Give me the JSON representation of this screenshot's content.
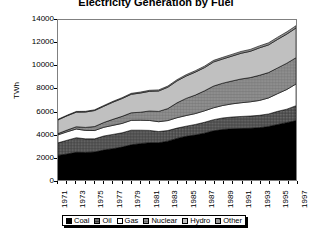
{
  "chart": {
    "title": "Electricity Generation by Fuel",
    "ylabel": "TWh"
  },
  "chart_data": {
    "type": "area",
    "title": "Electricity Generation by Fuel",
    "xlabel": "",
    "ylabel": "TWh",
    "ylim": [
      0,
      14000
    ],
    "ytick_labels": [
      "14000",
      "12000",
      "10000",
      "8000",
      "6000",
      "4000",
      "2000",
      "0"
    ],
    "ytick_values": [
      14000,
      12000,
      10000,
      8000,
      6000,
      4000,
      2000,
      0
    ],
    "grid": false,
    "stacked": true,
    "legend_position": "bottom",
    "x": [
      1971,
      1972,
      1973,
      1974,
      1975,
      1976,
      1977,
      1978,
      1979,
      1980,
      1981,
      1982,
      1983,
      1984,
      1985,
      1986,
      1987,
      1988,
      1989,
      1990,
      1991,
      1992,
      1993,
      1994,
      1995,
      1996,
      1997
    ],
    "xtick_labels": [
      "1971",
      "1973",
      "1975",
      "1977",
      "1979",
      "1981",
      "1983",
      "1985",
      "1987",
      "1989",
      "1991",
      "1993",
      "1995",
      "1997"
    ],
    "xtick_values": [
      1971,
      1973,
      1975,
      1977,
      1979,
      1981,
      1983,
      1985,
      1987,
      1989,
      1991,
      1993,
      1995,
      1997
    ],
    "series": [
      {
        "name": "Coal",
        "color": "#000000",
        "pattern": "solid",
        "values": [
          2150,
          2280,
          2420,
          2400,
          2450,
          2620,
          2740,
          2880,
          3080,
          3180,
          3260,
          3260,
          3400,
          3640,
          3830,
          3930,
          4100,
          4300,
          4420,
          4480,
          4500,
          4520,
          4580,
          4680,
          4860,
          5020,
          5200
        ]
      },
      {
        "name": "Oil",
        "color": "#666666",
        "pattern": "crosshatch",
        "values": [
          1100,
          1200,
          1280,
          1200,
          1150,
          1230,
          1250,
          1250,
          1280,
          1180,
          1080,
          980,
          930,
          900,
          880,
          930,
          950,
          980,
          1010,
          1030,
          1060,
          1080,
          1080,
          1100,
          1150,
          1180,
          1300
        ]
      },
      {
        "name": "Gas",
        "color": "#ffffff",
        "pattern": "solid",
        "values": [
          700,
          740,
          760,
          740,
          730,
          760,
          790,
          820,
          860,
          870,
          870,
          860,
          870,
          910,
          930,
          950,
          1000,
          1040,
          1090,
          1150,
          1200,
          1240,
          1300,
          1400,
          1550,
          1720,
          1900
        ]
      },
      {
        "name": "Nuclear",
        "color": "#808080",
        "pattern": "hatch",
        "values": [
          110,
          150,
          200,
          260,
          350,
          420,
          530,
          620,
          660,
          700,
          830,
          900,
          1050,
          1300,
          1500,
          1620,
          1750,
          1900,
          1950,
          2000,
          2080,
          2120,
          2200,
          2220,
          2250,
          2300,
          2300
        ]
      },
      {
        "name": "Hydro",
        "color": "#c0c0c0",
        "pattern": "solid",
        "values": [
          1200,
          1250,
          1280,
          1350,
          1400,
          1420,
          1500,
          1560,
          1620,
          1680,
          1720,
          1790,
          1870,
          1920,
          1960,
          2010,
          2030,
          2110,
          2120,
          2180,
          2250,
          2300,
          2400,
          2420,
          2500,
          2550,
          2600
        ]
      },
      {
        "name": "Other",
        "color": "#999999",
        "pattern": "dense",
        "values": [
          50,
          55,
          58,
          60,
          62,
          66,
          70,
          74,
          80,
          85,
          90,
          95,
          100,
          108,
          115,
          122,
          130,
          138,
          145,
          152,
          158,
          165,
          172,
          180,
          188,
          194,
          200
        ]
      }
    ],
    "totals": [
      5310,
      5675,
      5998,
      6010,
      6142,
      6518,
      6880,
      7204,
      7580,
      7693,
      7850,
      7885,
      8220,
      8778,
      9215,
      9562,
      9960,
      10468,
      10735,
      10992,
      11248,
      11425,
      11732,
      12000,
      12498,
      12964,
      13500
    ]
  },
  "legend": {
    "items": [
      {
        "label": "Coal"
      },
      {
        "label": "Oil"
      },
      {
        "label": "Gas"
      },
      {
        "label": "Nuclear"
      },
      {
        "label": "Hydro"
      },
      {
        "label": "Other"
      }
    ]
  }
}
